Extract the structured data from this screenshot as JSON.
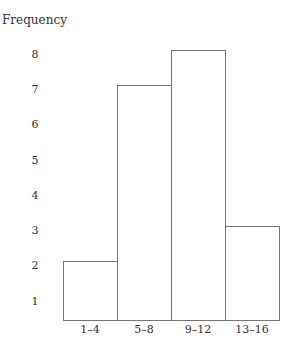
{
  "chart_data": {
    "type": "bar",
    "title": "",
    "xlabel": "",
    "ylabel": "Frequency",
    "categories": [
      "1–4",
      "5–8",
      "9–12",
      "13–16"
    ],
    "values": [
      2,
      7,
      8,
      3
    ],
    "yticks": [
      "1",
      "2",
      "3",
      "4",
      "5",
      "6",
      "7",
      "8"
    ],
    "ylim": [
      0,
      8
    ],
    "grid": false,
    "legend": null,
    "style": "histogram"
  }
}
